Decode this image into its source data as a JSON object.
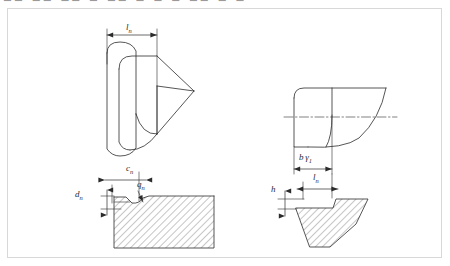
{
  "page": {
    "background_color": "#ffffff",
    "frame_border_color": "#d8d8d8",
    "line_color": "#2b2b2b",
    "hatch_color": "#5a5a5a",
    "top_strip_text": "▃▃  ▃▃   ▃▃   ▃   ▃▃   ▃  ▃     ▃   ▃▃   ▃   ▃"
  },
  "labels": {
    "top_left_ln": "l",
    "top_left_ln_sub": "n",
    "detail_left_cn": "c",
    "detail_left_cn_sub": "n",
    "detail_left_qn": "q",
    "detail_left_qn_sub": "n",
    "detail_left_dn": "d",
    "detail_left_dn_sub": "n",
    "top_right_b": "b",
    "top_right_gamma": "γ",
    "top_right_gamma_sub": "1",
    "detail_right_h": "h",
    "detail_right_ln": "l",
    "detail_right_ln_sub": "n"
  },
  "views": {
    "upper_left": {
      "name": "isometric-rounded-land-view",
      "dimension": "l_n"
    },
    "lower_left": {
      "name": "section-detail-left",
      "dimensions": [
        "c_n",
        "q_n",
        "d_n"
      ]
    },
    "upper_right": {
      "name": "front-profile-view",
      "dimension": "b γ1",
      "has_centerline": true
    },
    "lower_right": {
      "name": "section-detail-right",
      "dimensions": [
        "h",
        "l_n"
      ]
    }
  }
}
